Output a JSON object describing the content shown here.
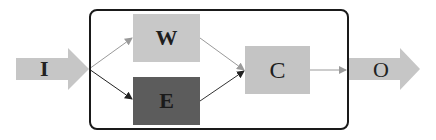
{
  "diagram": {
    "input": {
      "label": "I"
    },
    "output": {
      "label": "O"
    },
    "nodes": [
      {
        "id": "W",
        "label": "W",
        "color": "#c8c8c8"
      },
      {
        "id": "E",
        "label": "E",
        "color": "#5c5c5c"
      },
      {
        "id": "C",
        "label": "C",
        "color": "#c4c4c4"
      }
    ],
    "edges": [
      {
        "from": "I",
        "to": "W"
      },
      {
        "from": "I",
        "to": "E"
      },
      {
        "from": "W",
        "to": "C"
      },
      {
        "from": "E",
        "to": "C"
      },
      {
        "from": "C",
        "to": "O"
      }
    ],
    "colors": {
      "arrow_fill": "#c6c6c6",
      "frame": "#1a1a1a"
    }
  }
}
